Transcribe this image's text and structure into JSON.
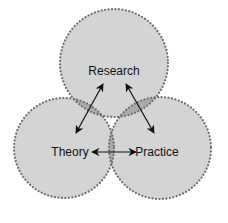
{
  "diagram": {
    "type": "venn",
    "circles": [
      {
        "id": "research",
        "label": "Research",
        "cx": 114,
        "cy": 63,
        "r": 54
      },
      {
        "id": "theory",
        "label": "Theory",
        "cx": 64,
        "cy": 148,
        "r": 50
      },
      {
        "id": "practice",
        "label": "Practice",
        "cx": 160,
        "cy": 148,
        "r": 51
      }
    ],
    "arrows": [
      {
        "from": "Research",
        "to": "Theory",
        "bidirectional": true
      },
      {
        "from": "Research",
        "to": "Practice",
        "bidirectional": true
      },
      {
        "from": "Theory",
        "to": "Practice",
        "bidirectional": true
      }
    ],
    "colors": {
      "fill": "#d3d3d3",
      "overlap": "#aaaaaa",
      "border": "#777777",
      "arrow": "#111111"
    }
  },
  "labels": {
    "research": "Research",
    "theory": "Theory",
    "practice": "Practice"
  }
}
